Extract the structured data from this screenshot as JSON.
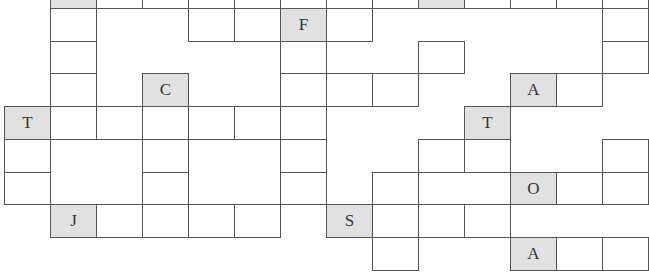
{
  "puzzle": {
    "type": "crossword-grid",
    "cell_width": 46,
    "colors": {
      "line": "#555555",
      "shaded": "#e1e1e1",
      "empty": "#ffffff",
      "letter": "#333333"
    },
    "cols_x": [
      4,
      50,
      96,
      142,
      188,
      234,
      280,
      326,
      372,
      418,
      464,
      510,
      556,
      602,
      648
    ],
    "rows_y": [
      -25,
      8,
      41,
      73,
      106,
      139,
      172,
      204,
      237,
      270
    ],
    "cells": [
      {
        "c": 1,
        "r": 0,
        "letter": "",
        "shaded": true
      },
      {
        "c": 2,
        "r": 0,
        "letter": "",
        "shaded": false
      },
      {
        "c": 3,
        "r": 0,
        "letter": "",
        "shaded": false
      },
      {
        "c": 4,
        "r": 0,
        "letter": "",
        "shaded": false
      },
      {
        "c": 5,
        "r": 0,
        "letter": "",
        "shaded": false
      },
      {
        "c": 6,
        "r": 0,
        "letter": "",
        "shaded": false
      },
      {
        "c": 7,
        "r": 0,
        "letter": "",
        "shaded": false
      },
      {
        "c": 8,
        "r": 0,
        "letter": "",
        "shaded": false
      },
      {
        "c": 9,
        "r": 0,
        "letter": "",
        "shaded": true
      },
      {
        "c": 10,
        "r": 0,
        "letter": "",
        "shaded": false
      },
      {
        "c": 11,
        "r": 0,
        "letter": "",
        "shaded": false
      },
      {
        "c": 12,
        "r": 0,
        "letter": "",
        "shaded": false
      },
      {
        "c": 13,
        "r": 0,
        "letter": "",
        "shaded": false
      },
      {
        "c": 1,
        "r": 1,
        "letter": "",
        "shaded": false
      },
      {
        "c": 4,
        "r": 1,
        "letter": "",
        "shaded": false
      },
      {
        "c": 5,
        "r": 1,
        "letter": "",
        "shaded": false
      },
      {
        "c": 6,
        "r": 1,
        "letter": "F",
        "shaded": true
      },
      {
        "c": 7,
        "r": 1,
        "letter": "",
        "shaded": false
      },
      {
        "c": 13,
        "r": 1,
        "letter": "",
        "shaded": false
      },
      {
        "c": 1,
        "r": 2,
        "letter": "",
        "shaded": false
      },
      {
        "c": 6,
        "r": 2,
        "letter": "",
        "shaded": false
      },
      {
        "c": 9,
        "r": 2,
        "letter": "",
        "shaded": false
      },
      {
        "c": 13,
        "r": 2,
        "letter": "",
        "shaded": false
      },
      {
        "c": 1,
        "r": 3,
        "letter": "",
        "shaded": false
      },
      {
        "c": 3,
        "r": 3,
        "letter": "C",
        "shaded": true
      },
      {
        "c": 6,
        "r": 3,
        "letter": "",
        "shaded": false
      },
      {
        "c": 7,
        "r": 3,
        "letter": "",
        "shaded": false
      },
      {
        "c": 8,
        "r": 3,
        "letter": "",
        "shaded": false
      },
      {
        "c": 11,
        "r": 3,
        "letter": "A",
        "shaded": true
      },
      {
        "c": 12,
        "r": 3,
        "letter": "",
        "shaded": false
      },
      {
        "c": 0,
        "r": 4,
        "letter": "T",
        "shaded": true
      },
      {
        "c": 1,
        "r": 4,
        "letter": "",
        "shaded": false
      },
      {
        "c": 2,
        "r": 4,
        "letter": "",
        "shaded": false
      },
      {
        "c": 3,
        "r": 4,
        "letter": "",
        "shaded": false
      },
      {
        "c": 4,
        "r": 4,
        "letter": "",
        "shaded": false
      },
      {
        "c": 5,
        "r": 4,
        "letter": "",
        "shaded": false
      },
      {
        "c": 6,
        "r": 4,
        "letter": "",
        "shaded": false
      },
      {
        "c": 10,
        "r": 4,
        "letter": "T",
        "shaded": true
      },
      {
        "c": 0,
        "r": 5,
        "letter": "",
        "shaded": false
      },
      {
        "c": 3,
        "r": 5,
        "letter": "",
        "shaded": false
      },
      {
        "c": 6,
        "r": 5,
        "letter": "",
        "shaded": false
      },
      {
        "c": 9,
        "r": 5,
        "letter": "",
        "shaded": false
      },
      {
        "c": 10,
        "r": 5,
        "letter": "",
        "shaded": false
      },
      {
        "c": 13,
        "r": 5,
        "letter": "",
        "shaded": false
      },
      {
        "c": 0,
        "r": 6,
        "letter": "",
        "shaded": false
      },
      {
        "c": 3,
        "r": 6,
        "letter": "",
        "shaded": false
      },
      {
        "c": 6,
        "r": 6,
        "letter": "",
        "shaded": false
      },
      {
        "c": 8,
        "r": 6,
        "letter": "",
        "shaded": false
      },
      {
        "c": 11,
        "r": 6,
        "letter": "O",
        "shaded": true
      },
      {
        "c": 12,
        "r": 6,
        "letter": "",
        "shaded": false
      },
      {
        "c": 13,
        "r": 6,
        "letter": "",
        "shaded": false
      },
      {
        "c": 1,
        "r": 7,
        "letter": "J",
        "shaded": true
      },
      {
        "c": 2,
        "r": 7,
        "letter": "",
        "shaded": false
      },
      {
        "c": 3,
        "r": 7,
        "letter": "",
        "shaded": false
      },
      {
        "c": 4,
        "r": 7,
        "letter": "",
        "shaded": false
      },
      {
        "c": 5,
        "r": 7,
        "letter": "",
        "shaded": false
      },
      {
        "c": 7,
        "r": 7,
        "letter": "S",
        "shaded": true
      },
      {
        "c": 8,
        "r": 7,
        "letter": "",
        "shaded": false
      },
      {
        "c": 9,
        "r": 7,
        "letter": "",
        "shaded": false
      },
      {
        "c": 10,
        "r": 7,
        "letter": "",
        "shaded": false
      },
      {
        "c": 8,
        "r": 8,
        "letter": "",
        "shaded": false
      },
      {
        "c": 11,
        "r": 8,
        "letter": "A",
        "shaded": true
      },
      {
        "c": 12,
        "r": 8,
        "letter": "",
        "shaded": false
      },
      {
        "c": 13,
        "r": 8,
        "letter": "",
        "shaded": false
      }
    ],
    "merged_blocks": [
      {
        "x": 96,
        "y": 41,
        "w": 46,
        "h": 65,
        "note": "open area left of C"
      },
      {
        "x": 50,
        "y": 139,
        "w": 92,
        "h": 65
      },
      {
        "x": 188,
        "y": 139,
        "w": 92,
        "h": 65
      },
      {
        "x": 418,
        "y": 8,
        "w": 184,
        "h": 33
      },
      {
        "x": 510,
        "y": 204,
        "w": 138,
        "h": 33
      }
    ]
  }
}
